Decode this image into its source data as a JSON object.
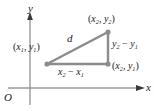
{
  "figure": {
    "axes": {
      "y_axis_label": "y",
      "x_axis_label": "x",
      "origin_label": "O"
    },
    "labels": {
      "point1": "(x₁, y₁)",
      "point2": "(x₂, y₂)",
      "point_mixed": "(x₂, y₁)",
      "distance": "d",
      "vertical_leg": "y₂ − y₁",
      "horizontal_leg": "x₂ − x₁"
    },
    "parts": {
      "point1_base": "x",
      "point1_sub_a": "1",
      "point1_sub_b": "1",
      "point2_base": "x",
      "point2_sub_a": "2",
      "point2_sub_b": "2",
      "mixed_sub_a": "2",
      "mixed_sub_b": "1",
      "y_base": "y",
      "x_base": "x",
      "sub_one": "1",
      "sub_two": "2",
      "minus": "−",
      "comma": ",",
      "open_paren": "(",
      "close_paren": ")"
    },
    "geometry": {
      "vertex_bottom_left": [
        47,
        64
      ],
      "vertex_top_right": [
        108,
        32
      ],
      "vertex_bottom_right": [
        108,
        64
      ],
      "y_axis_x": 30,
      "x_axis_y": 88
    },
    "colors": {
      "triangle_stroke": "#8c8c8c",
      "axis_stroke": "#9a9a9a",
      "vertex_dot": "#8c8c8c",
      "text": "#1a1a1a",
      "background": "#ffffff"
    }
  }
}
